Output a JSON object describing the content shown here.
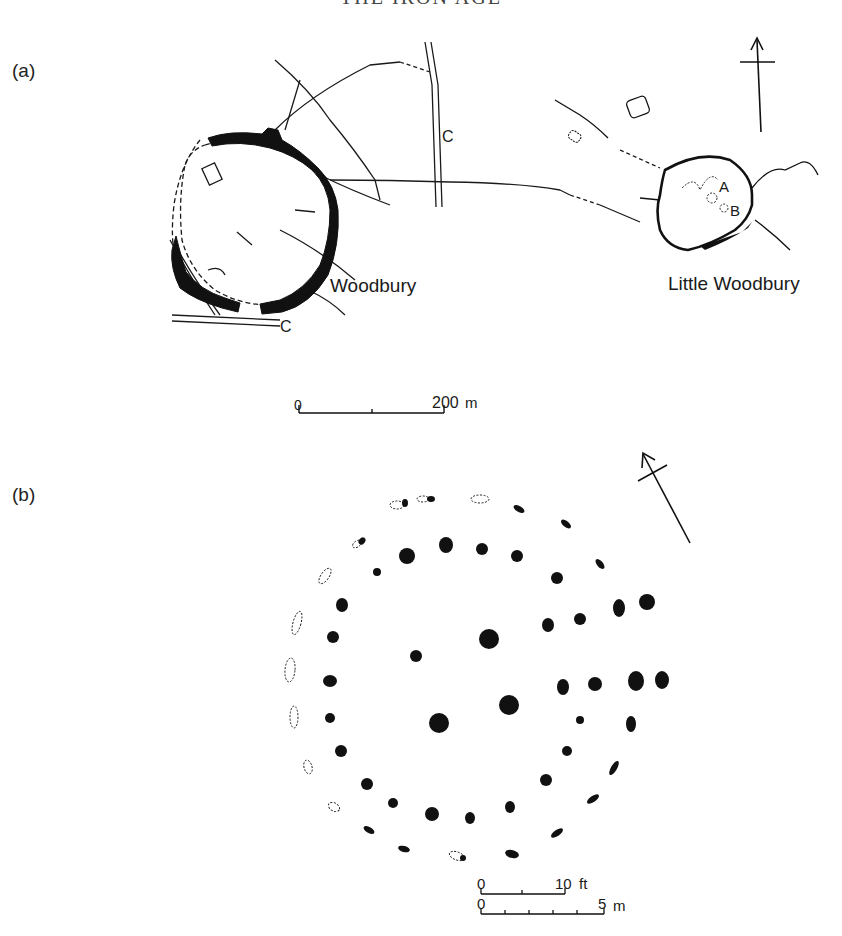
{
  "running_head": "THE IRON AGE",
  "panel_a": {
    "label": "(a)",
    "sites": [
      {
        "name": "Woodbury"
      },
      {
        "name": "Little Woodbury"
      }
    ],
    "road_label_1": "C",
    "road_label_2": "C",
    "feature_labels": [
      "A",
      "B"
    ],
    "scale": {
      "start": "0",
      "end": "200",
      "unit": "m"
    },
    "north_arrow": "north-arrow"
  },
  "panel_b": {
    "label": "(b)",
    "scale_ft": {
      "start": "0",
      "end": "10",
      "unit": "ft"
    },
    "scale_m": {
      "start": "0",
      "end": "5",
      "unit": "m"
    },
    "north_arrow": "north-arrow"
  }
}
